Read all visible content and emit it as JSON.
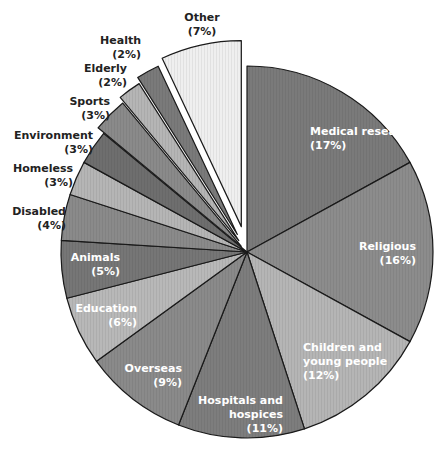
{
  "chart_data": {
    "type": "pie",
    "title": "",
    "center": [
      247,
      252
    ],
    "radius": 186,
    "start_angle_deg": 0,
    "slices": [
      {
        "label": "Medical research",
        "value": 17,
        "pct_label": "(17%)",
        "color": "#7a7a7a",
        "explode": 0,
        "label_color": "#ffffff",
        "label_pos": [
          310,
          135
        ],
        "label_lines": [
          "Medical research",
          "(17%)"
        ],
        "anchor": "start"
      },
      {
        "label": "Religious",
        "value": 16,
        "pct_label": "(16%)",
        "color": "#8c8c8c",
        "explode": 0,
        "label_color": "#ffffff",
        "label_pos": [
          416,
          250
        ],
        "label_lines": [
          "Religious",
          "(16%)"
        ],
        "anchor": "end"
      },
      {
        "label": "Children and young people",
        "value": 12,
        "pct_label": "(12%)",
        "color": "#b5b5b5",
        "explode": 0,
        "label_color": "#ffffff",
        "label_pos": [
          303,
          351
        ],
        "label_lines": [
          "Children and",
          "young people",
          "(12%)"
        ],
        "anchor": "start"
      },
      {
        "label": "Hospitals and hospices",
        "value": 11,
        "pct_label": "(11%)",
        "color": "#7d7d7d",
        "explode": 0,
        "label_color": "#ffffff",
        "label_pos": [
          283,
          404
        ],
        "label_lines": [
          "Hospitals and",
          "hospices",
          "(11%)"
        ],
        "anchor": "end"
      },
      {
        "label": "Overseas",
        "value": 9,
        "pct_label": "(9%)",
        "color": "#8a8a8a",
        "explode": 0,
        "label_color": "#ffffff",
        "label_pos": [
          182,
          372
        ],
        "label_lines": [
          "Overseas",
          "(9%)"
        ],
        "anchor": "end"
      },
      {
        "label": "Education",
        "value": 6,
        "pct_label": "(6%)",
        "color": "#b8b8b8",
        "explode": 0,
        "label_color": "#ffffff",
        "label_pos": [
          137,
          312
        ],
        "label_lines": [
          "Education",
          "(6%)"
        ],
        "anchor": "end"
      },
      {
        "label": "Animals",
        "value": 5,
        "pct_label": "(5%)",
        "color": "#767676",
        "explode": 0,
        "label_color": "#ffffff",
        "label_pos": [
          120,
          261
        ],
        "label_lines": [
          "Animals",
          "(5%)"
        ],
        "anchor": "end"
      },
      {
        "label": "Disabled",
        "value": 4,
        "pct_label": "(4%)",
        "color": "#8a8a8a",
        "explode": 0,
        "label_color": "#222222",
        "label_pos": [
          66,
          215
        ],
        "label_lines": [
          "Disabled",
          "(4%)"
        ],
        "anchor": "end"
      },
      {
        "label": "Homeless",
        "value": 3,
        "pct_label": "(3%)",
        "color": "#b5b5b5",
        "explode": 0,
        "label_color": "#222222",
        "label_pos": [
          73,
          172
        ],
        "label_lines": [
          "Homeless",
          "(3%)"
        ],
        "anchor": "end"
      },
      {
        "label": "Environment",
        "value": 3,
        "pct_label": "(3%)",
        "color": "#6e6e6e",
        "explode": 0,
        "label_color": "#222222",
        "label_pos": [
          93,
          139
        ],
        "label_lines": [
          "Environment",
          "(3%)"
        ],
        "anchor": "end"
      },
      {
        "label": "Sports",
        "value": 3,
        "pct_label": "(3%)",
        "color": "#8a8a8a",
        "explode": 8,
        "label_color": "#222222",
        "label_pos": [
          110,
          105
        ],
        "label_lines": [
          "Sports",
          "(3%)"
        ],
        "anchor": "end"
      },
      {
        "label": "Elderly",
        "value": 2,
        "pct_label": "(2%)",
        "color": "#b5b5b5",
        "explode": 14,
        "label_color": "#222222",
        "label_pos": [
          127,
          72
        ],
        "label_lines": [
          "Elderly",
          "(2%)"
        ],
        "anchor": "end"
      },
      {
        "label": "Health",
        "value": 2,
        "pct_label": "(2%)",
        "color": "#7a7a7a",
        "explode": 20,
        "label_color": "#222222",
        "label_pos": [
          141,
          44
        ],
        "label_lines": [
          "Health",
          "(2%)"
        ],
        "anchor": "end"
      },
      {
        "label": "Other",
        "value": 7,
        "pct_label": "(7%)",
        "color": "#efefef",
        "explode": 26,
        "label_color": "#222222",
        "label_pos": [
          202,
          21
        ],
        "label_lines": [
          "Other",
          "(7%)"
        ],
        "anchor": "middle"
      }
    ],
    "legend": "none (labels placed on/around slices)"
  }
}
